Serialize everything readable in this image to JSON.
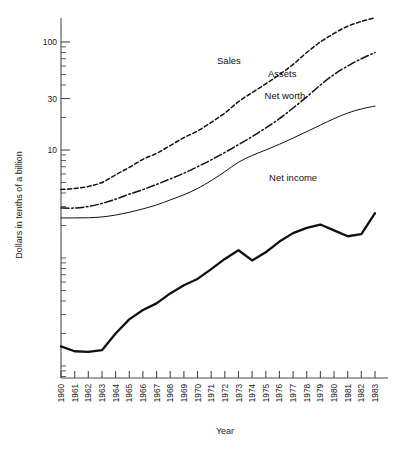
{
  "chart_data": {
    "type": "line",
    "title": "",
    "xlabel": "Year",
    "ylabel": "Dollars in tenths of a billion",
    "yscale": "log",
    "ylim": [
      0.1,
      200
    ],
    "y_major_ticks": [
      10,
      30,
      100
    ],
    "y_major_tick_labels": [
      "10",
      "30",
      "100"
    ],
    "grid": false,
    "legend_position": "inline-labels",
    "x": [
      1960,
      1961,
      1962,
      1963,
      1964,
      1965,
      1966,
      1967,
      1968,
      1969,
      1970,
      1971,
      1972,
      1973,
      1974,
      1975,
      1976,
      1977,
      1978,
      1979,
      1980,
      1981,
      1982,
      1983
    ],
    "x_tick_labels": [
      "1960",
      "1961",
      "1962",
      "1963",
      "1964",
      "1965",
      "1966",
      "1967",
      "1968",
      "1969",
      "1970",
      "1971",
      "1972",
      "1973",
      "1974",
      "1975",
      "1976",
      "1977",
      "1978",
      "1979",
      "1980",
      "1981",
      "1982",
      "1983"
    ],
    "series": [
      {
        "name": "Sales",
        "style": "dashed",
        "label_x": 1972.3,
        "label_y": 62,
        "values": [
          4.3,
          4.4,
          4.6,
          5.0,
          5.9,
          6.9,
          8.2,
          9.3,
          11.0,
          13.0,
          15.0,
          18.0,
          22.0,
          28.0,
          34.0,
          41.0,
          50.0,
          62.0,
          80.0,
          100.0,
          120.0,
          140.0,
          155.0,
          168.0
        ]
      },
      {
        "name": "Assets",
        "style": "dash-dot",
        "label_x": 1976.2,
        "label_y": 47,
        "values": [
          2.9,
          2.9,
          3.0,
          3.2,
          3.5,
          3.9,
          4.3,
          4.8,
          5.4,
          6.1,
          7.0,
          8.1,
          9.5,
          11.2,
          13.3,
          16.0,
          19.5,
          24.5,
          31.0,
          40.0,
          50.0,
          60.0,
          70.0,
          80.0
        ]
      },
      {
        "name": "Net worth",
        "style": "solid-thin",
        "label_x": 1976.4,
        "label_y": 30,
        "values": [
          2.35,
          2.35,
          2.36,
          2.4,
          2.5,
          2.65,
          2.85,
          3.1,
          3.45,
          3.85,
          4.4,
          5.2,
          6.3,
          7.7,
          8.9,
          10.0,
          11.3,
          12.9,
          14.8,
          17.0,
          19.5,
          22.0,
          24.0,
          25.5
        ]
      },
      {
        "name": "Net income",
        "style": "solid-thick",
        "label_x": 1977.0,
        "label_y": 5.2,
        "values": [
          0.152,
          0.137,
          0.135,
          0.14,
          0.2,
          0.27,
          0.33,
          0.38,
          0.47,
          0.56,
          0.64,
          0.79,
          0.98,
          1.18,
          0.95,
          1.13,
          1.42,
          1.7,
          1.9,
          2.04,
          1.8,
          1.59,
          1.66,
          2.6
        ]
      }
    ]
  },
  "footnote": "",
  "axis": {
    "y_title": "Dollars in tenths of a billion",
    "x_title": "Year"
  }
}
